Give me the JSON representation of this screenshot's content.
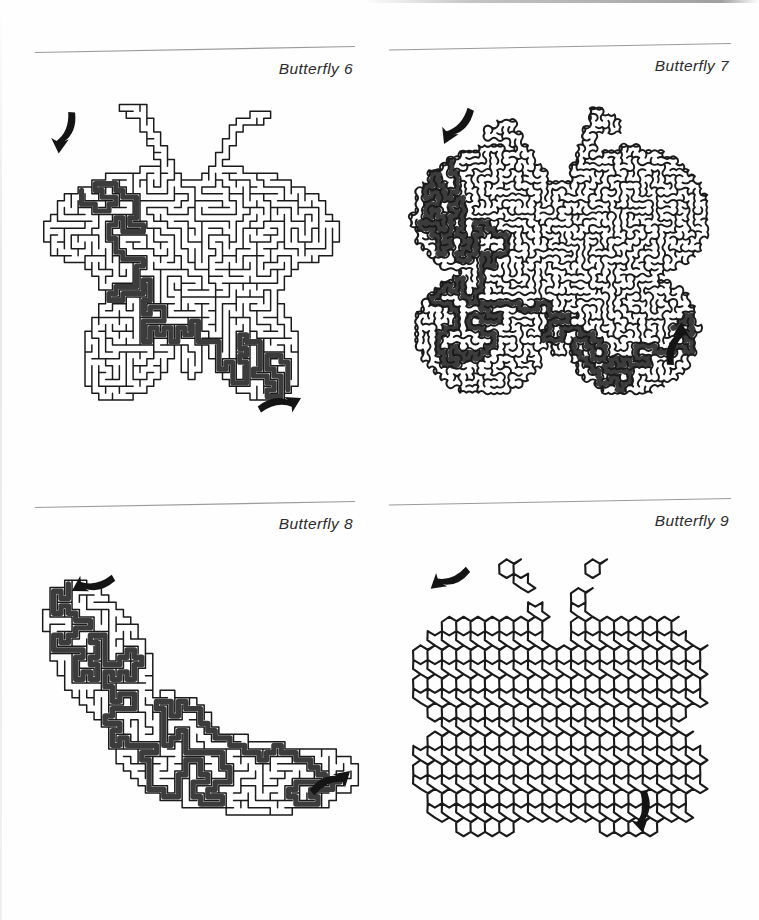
{
  "page": {
    "kind": "maze-puzzle-book-page",
    "background_color": "#fefefe",
    "wall_color": "#1a1a1a",
    "solution_color": "#3c3c3c",
    "rule_color": "#9a9a9a",
    "caption_color": "#2b2b2b"
  },
  "panels": [
    {
      "id": "q6",
      "caption": "Butterfly 6",
      "maze": {
        "style": "orthogonal",
        "shape": "butterfly-spread-wings",
        "cell_size": 7,
        "wall_width": 1.5,
        "solution_width": 5.2,
        "entry_arrow": {
          "label": "entry-arrow",
          "direction": "down",
          "x": 30,
          "y": 48,
          "rotate": 95
        },
        "exit_arrow": {
          "label": "exit-arrow",
          "direction": "right",
          "x": 268,
          "y": 310,
          "rotate": -28
        },
        "seed": 10607
      }
    },
    {
      "id": "q7",
      "caption": "Butterfly 7",
      "maze": {
        "style": "curvy",
        "shape": "butterfly-round-wings",
        "cell_size": 6.2,
        "wall_width": 1.9,
        "solution_width": 6.0,
        "entry_arrow": {
          "label": "entry-arrow",
          "direction": "down",
          "x": 56,
          "y": 40,
          "rotate": 115
        },
        "exit_arrow": {
          "label": "exit-arrow",
          "direction": "up",
          "x": 290,
          "y": 236,
          "rotate": -88
        },
        "seed": 20717
      }
    },
    {
      "id": "q8",
      "caption": "Butterfly 8",
      "maze": {
        "style": "orthogonal",
        "shape": "moth-resting",
        "cell_size": 7.4,
        "wall_width": 1.5,
        "solution_width": 5.4,
        "entry_arrow": {
          "label": "entry-arrow",
          "direction": "down-left",
          "x": 52,
          "y": 36,
          "rotate": 150
        },
        "exit_arrow": {
          "label": "exit-arrow",
          "direction": "right",
          "x": 318,
          "y": 228,
          "rotate": -42
        },
        "seed": 30829
      }
    },
    {
      "id": "q9",
      "caption": "Butterfly 9",
      "maze": {
        "style": "triangular",
        "shape": "butterfly-broad-wings",
        "cell_size": 15,
        "wall_width": 2.2,
        "solution_width": 7.5,
        "entry_arrow": {
          "label": "entry-arrow",
          "direction": "down-left",
          "x": 40,
          "y": 40,
          "rotate": 140
        },
        "exit_arrow": {
          "label": "exit-arrow",
          "direction": "down",
          "x": 253,
          "y": 292,
          "rotate": 78
        },
        "seed": 40931
      }
    }
  ]
}
